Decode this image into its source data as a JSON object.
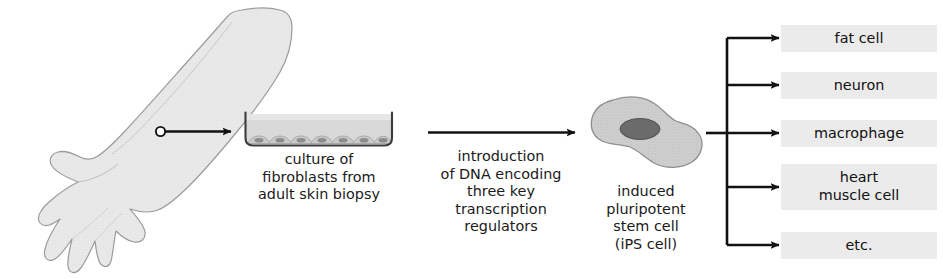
{
  "figure": {
    "background_color": "#ffffff",
    "ink_color": "#1a1a1a",
    "box_fill_color": "#ebebeb",
    "tissue_fill_color": "#ebebeb",
    "tissue_stroke_color": "#9a9a9a",
    "cell_fill_color": "#cfcfcf",
    "nucleus_fill_color": "#6b6b6b",
    "medium_fill_color": "#d8d8d8"
  },
  "stages": {
    "arm": {
      "name": "human forearm and hand",
      "biopsy_marker": "biopsy site"
    },
    "dish": {
      "name": "culture dish",
      "cell_count": 7,
      "caption": "culture of\nfibroblasts from\nadult skin biopsy"
    },
    "transduction": {
      "caption": "introduction\nof DNA encoding\nthree key\ntranscription\nregulators"
    },
    "ips": {
      "name": "induced pluripotent stem cell",
      "caption": "induced\npluripotent\nstem cell\n(iPS cell)"
    }
  },
  "outcomes": [
    {
      "label": "fat cell"
    },
    {
      "label": "neuron"
    },
    {
      "label": "macrophage"
    },
    {
      "label": "heart\nmuscle cell"
    },
    {
      "label": "etc."
    }
  ]
}
